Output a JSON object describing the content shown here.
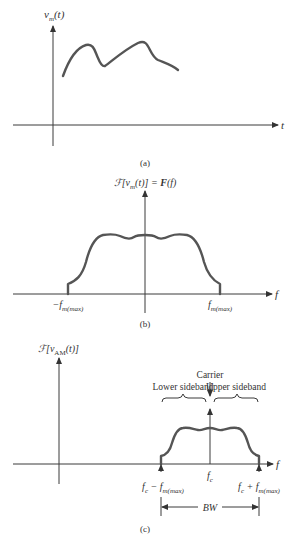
{
  "figure": {
    "panels": [
      {
        "id": "a",
        "caption": "(a)",
        "y_label": {
          "main": "v",
          "sub": "m",
          "arg": "(t)"
        },
        "x_label": "t",
        "description": "Arbitrary modulating signal v_m(t) in the time domain"
      },
      {
        "id": "b",
        "caption": "(b)",
        "y_label": {
          "script": "ℱ",
          "bracket_open": "[",
          "main": "v",
          "sub": "m",
          "arg": "(t)",
          "bracket_close": "]",
          "eq": " = ",
          "bold": "F",
          "f_arg": "(f)"
        },
        "x_label": "f",
        "left_tick": {
          "neg": "−",
          "f": "f",
          "sub": "m(max)"
        },
        "right_tick": {
          "f": "f",
          "sub": "m(max)"
        },
        "description": "Baseband spectrum of the modulating signal, symmetric about f = 0"
      },
      {
        "id": "c",
        "caption": "(c)",
        "y_label": {
          "script": "ℱ",
          "bracket_open": "[",
          "main": "v",
          "sub": "AM",
          "arg": "(t)",
          "bracket_close": "]"
        },
        "x_label": "f",
        "carrier_label": "Carrier",
        "lower_sideband_label": "Lower sideband",
        "upper_sideband_label": "Upper sideband",
        "center_tick": {
          "f": "f",
          "sub": "c"
        },
        "left_tick": {
          "f": "f",
          "sub": "c",
          "op": " − ",
          "f2": "f",
          "sub2": "m(max)"
        },
        "right_tick": {
          "f": "f",
          "sub": "c",
          "op": " + ",
          "f2": "f",
          "sub2": "m(max)"
        },
        "bandwidth_label": "BW",
        "description": "AM spectrum: carrier at f_c with lower and upper sidebands"
      }
    ]
  }
}
